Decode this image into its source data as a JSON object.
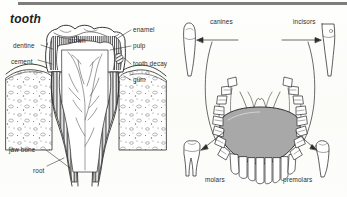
{
  "page": {
    "title": "tooth",
    "width": 347,
    "height": 197,
    "background_color": "#fdfdfb",
    "ink_color": "#2b2b2b",
    "rule_color": "#7d7d7d"
  },
  "figures": [
    {
      "id": "tooth-cross-section",
      "name": "tooth-cross-section-diagram",
      "description": "labelled cross-section of a molar tooth in the jaw"
    },
    {
      "id": "lower-jaw-arch",
      "name": "lower-jaw-arch-diagram",
      "description": "view of lower dental arch with tongue and four individual tooth types"
    }
  ],
  "left_diagram": {
    "name": "tooth-cross-section-diagram",
    "labels": [
      {
        "id": "dentine",
        "text": "dentine",
        "x": 13,
        "y": 43,
        "side": "left"
      },
      {
        "id": "cement",
        "text": "cement",
        "x": 11,
        "y": 59,
        "side": "left"
      },
      {
        "id": "jaw-bone",
        "text": "jaw bone",
        "x": 9,
        "y": 147,
        "side": "left"
      },
      {
        "id": "root",
        "text": "root",
        "x": 33,
        "y": 168,
        "side": "left"
      },
      {
        "id": "crown",
        "text": "crown",
        "x": 68,
        "y": 38,
        "side": "center"
      },
      {
        "id": "enamel",
        "text": "enamel",
        "x": 133,
        "y": 28,
        "side": "right"
      },
      {
        "id": "pulp",
        "text": "pulp",
        "x": 133,
        "y": 44,
        "side": "right"
      },
      {
        "id": "tooth-decay",
        "text": "tooth decay",
        "x": 133,
        "y": 62,
        "side": "right"
      },
      {
        "id": "gum",
        "text": "gum",
        "x": 133,
        "y": 78,
        "side": "right"
      }
    ]
  },
  "right_diagram": {
    "name": "lower-jaw-arch-diagram",
    "tongue_fill": "#a8a8a8",
    "labels": [
      {
        "id": "canines",
        "text": "canines",
        "x": 210,
        "y": 20,
        "side": "top-left"
      },
      {
        "id": "incisors",
        "text": "incisors",
        "x": 293,
        "y": 20,
        "side": "top-right"
      },
      {
        "id": "molars",
        "text": "molars",
        "x": 205,
        "y": 177,
        "side": "bottom-left"
      },
      {
        "id": "premolars",
        "text": "premolars",
        "x": 283,
        "y": 177,
        "side": "bottom-right"
      }
    ],
    "specimen_teeth": [
      {
        "id": "canine-specimen",
        "name": "canine-tooth-illustration",
        "x": 180,
        "y": 22
      },
      {
        "id": "incisor-specimen",
        "name": "incisor-tooth-illustration",
        "x": 317,
        "y": 22
      },
      {
        "id": "molar-specimen",
        "name": "molar-tooth-illustration",
        "x": 182,
        "y": 140
      },
      {
        "id": "premolar-specimen",
        "name": "premolar-tooth-illustration",
        "x": 315,
        "y": 140
      }
    ]
  }
}
